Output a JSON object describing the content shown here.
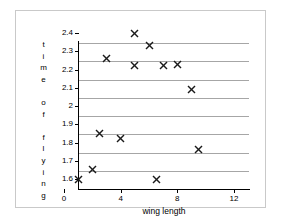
{
  "chart_data": {
    "type": "scatter",
    "title": "",
    "xlabel": "wing length",
    "ylabel": "time of flying",
    "xlim": [
      0,
      12
    ],
    "ylim": [
      1.6,
      2.4
    ],
    "xticks": [
      "0",
      "4",
      "8",
      "12"
    ],
    "xtick_values": [
      0,
      4,
      8,
      12
    ],
    "yticks": [
      "1.6",
      "1.7",
      "1.8",
      "1.9",
      "2",
      "2.1",
      "2.2",
      "2.3",
      "2.4"
    ],
    "ytick_values": [
      1.6,
      1.7,
      1.8,
      1.9,
      2.0,
      2.1,
      2.2,
      2.3,
      2.4
    ],
    "grid": "horizontal",
    "legend": "none",
    "marker": "x",
    "marker_color": "#1a1a1a",
    "points": [
      {
        "x": 1.0,
        "y": 1.6
      },
      {
        "x": 2.0,
        "y": 1.65
      },
      {
        "x": 2.5,
        "y": 1.85
      },
      {
        "x": 3.0,
        "y": 2.26
      },
      {
        "x": 4.0,
        "y": 1.82
      },
      {
        "x": 5.0,
        "y": 2.4
      },
      {
        "x": 5.0,
        "y": 2.22
      },
      {
        "x": 6.0,
        "y": 2.33
      },
      {
        "x": 6.5,
        "y": 1.6
      },
      {
        "x": 7.0,
        "y": 2.22
      },
      {
        "x": 8.0,
        "y": 2.23
      },
      {
        "x": 9.0,
        "y": 2.09
      },
      {
        "x": 9.5,
        "y": 1.76
      }
    ]
  },
  "axis": {
    "y_title_chars": [
      "t",
      "i",
      "m",
      "e",
      "",
      "o",
      "f",
      "",
      "f",
      "l",
      "y",
      "i",
      "n",
      "g"
    ]
  }
}
